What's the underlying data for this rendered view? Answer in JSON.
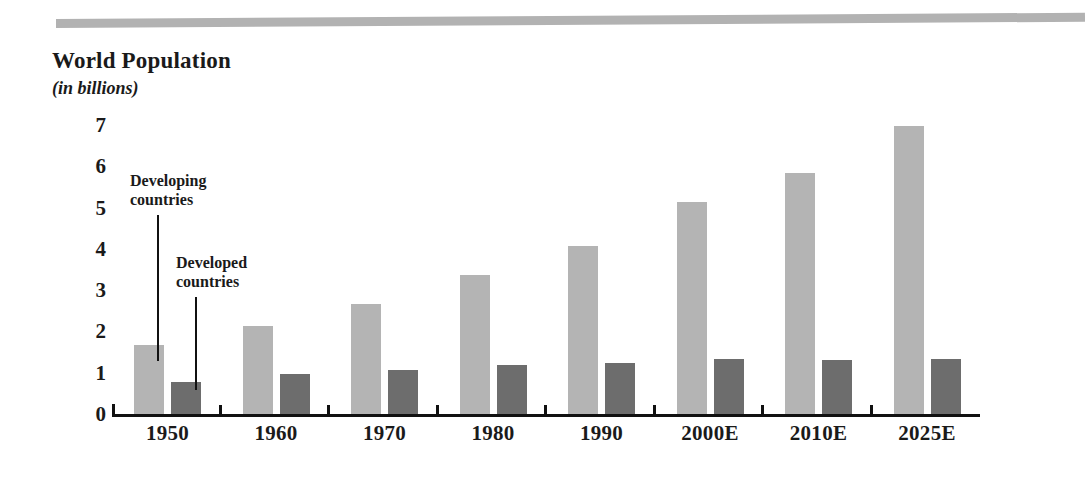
{
  "figure": {
    "title": "World Population",
    "subtitle": "(in billions)",
    "top_rule": "decorative-grey-band"
  },
  "annotations": [
    {
      "id": "developing",
      "line1": "Developing",
      "line2": "countries",
      "points_to": "1950 developing bar"
    },
    {
      "id": "developed",
      "line1": "Developed",
      "line2": "countries",
      "points_to": "1950 developed bar"
    }
  ],
  "colors": {
    "developing_bar": "#b4b4b4",
    "developed_bar": "#6d6d6d",
    "axis": "#111111",
    "top_rule": "#b2b2b2",
    "background": "#ffffff"
  },
  "chart_data": {
    "type": "bar",
    "title": "World Population",
    "subtitle": "(in billions)",
    "xlabel": "",
    "ylabel": "in billions",
    "ylim": [
      0,
      7
    ],
    "yticks": [
      0,
      1,
      2,
      3,
      4,
      5,
      6,
      7
    ],
    "ytick_labels": [
      "0",
      "1",
      "2",
      "3",
      "4",
      "5",
      "6",
      "7"
    ],
    "grid": false,
    "legend": "inline-callout",
    "categories": [
      "1950",
      "1960",
      "1970",
      "1980",
      "1990",
      "2000E",
      "2010E",
      "2025E"
    ],
    "series": [
      {
        "name": "Developing countries",
        "color": "#b4b4b4",
        "values": [
          1.7,
          2.15,
          2.7,
          3.4,
          4.1,
          5.15,
          5.85,
          7.0
        ]
      },
      {
        "name": "Developed countries",
        "color": "#6d6d6d",
        "values": [
          0.8,
          1.0,
          1.1,
          1.2,
          1.25,
          1.35,
          1.33,
          1.35
        ]
      }
    ]
  }
}
